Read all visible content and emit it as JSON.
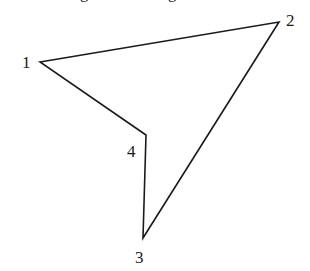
{
  "diagram": {
    "type": "polygon",
    "stroke_color": "#1a1a1a",
    "top_cut_text": "g g",
    "vertices": [
      {
        "label": "1",
        "x": 40,
        "y": 62,
        "label_x": 22,
        "label_y": 68
      },
      {
        "label": "2",
        "x": 279,
        "y": 22,
        "label_x": 286,
        "label_y": 26
      },
      {
        "label": "3",
        "x": 143,
        "y": 238,
        "label_x": 135,
        "label_y": 263
      },
      {
        "label": "4",
        "x": 146,
        "y": 135,
        "label_x": 127,
        "label_y": 157
      }
    ],
    "edges": [
      [
        "1",
        "2"
      ],
      [
        "2",
        "3"
      ],
      [
        "3",
        "4"
      ],
      [
        "4",
        "1"
      ]
    ]
  }
}
